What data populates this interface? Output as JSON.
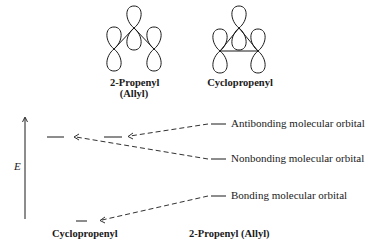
{
  "top": {
    "allyl_label_line1": "2-Propenyl",
    "allyl_label_line2": "(Allyl)",
    "cyclopropenyl_label": "Cyclopropenyl"
  },
  "diagram": {
    "axis_label": "E",
    "levels": {
      "antibonding": "Antibonding molecular orbital",
      "nonbonding": "Nonbonding molecular orbital",
      "bonding": "Bonding molecular orbital"
    },
    "bottom_left_label": "Cyclopropenyl",
    "bottom_right_label": "2-Propenyl (Allyl)"
  },
  "colors": {
    "ink": "#1a1a1a",
    "background": "#ffffff"
  }
}
